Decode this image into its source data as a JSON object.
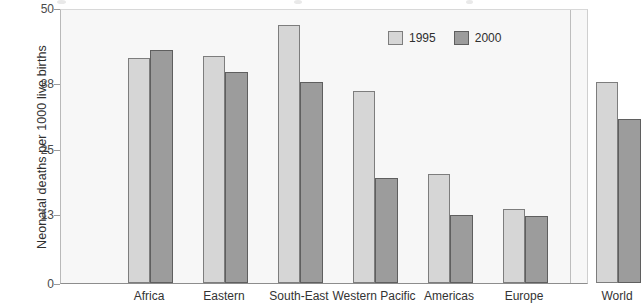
{
  "chart_data": {
    "type": "bar",
    "title": "",
    "xlabel": "",
    "ylabel": "Neonatal deaths per 1000 live births",
    "categories": [
      "Africa",
      "Eastern",
      "South-East",
      "Western Pacific",
      "Americas",
      "Europe",
      "World"
    ],
    "series": [
      {
        "name": "1995",
        "color": "#d6d6d6",
        "values": [
          41.3,
          41.6,
          47.3,
          35.1,
          20.0,
          13.6,
          36.9
        ]
      },
      {
        "name": "2000",
        "color": "#9c9c9c",
        "values": [
          42.7,
          38.7,
          36.9,
          19.3,
          12.5,
          12.2,
          30.0
        ]
      }
    ],
    "ylim": [
      0,
      50
    ],
    "yticks": [
      0,
      13,
      25,
      38,
      50
    ],
    "ytick_labels": [
      "0",
      "13",
      "25",
      "38",
      "50"
    ],
    "grid": false,
    "legend_position": "top-right",
    "separator_after_category": "Europe"
  },
  "legend": {
    "items": [
      {
        "label": "1995",
        "swatch": "legend-swatch-1995"
      },
      {
        "label": "2000",
        "swatch": "legend-swatch-2000"
      }
    ]
  },
  "axis": {
    "y_title": "Neonatal deaths per 1000 live births",
    "y_ticks": [
      "50",
      "38",
      "25",
      "13",
      "0"
    ]
  }
}
